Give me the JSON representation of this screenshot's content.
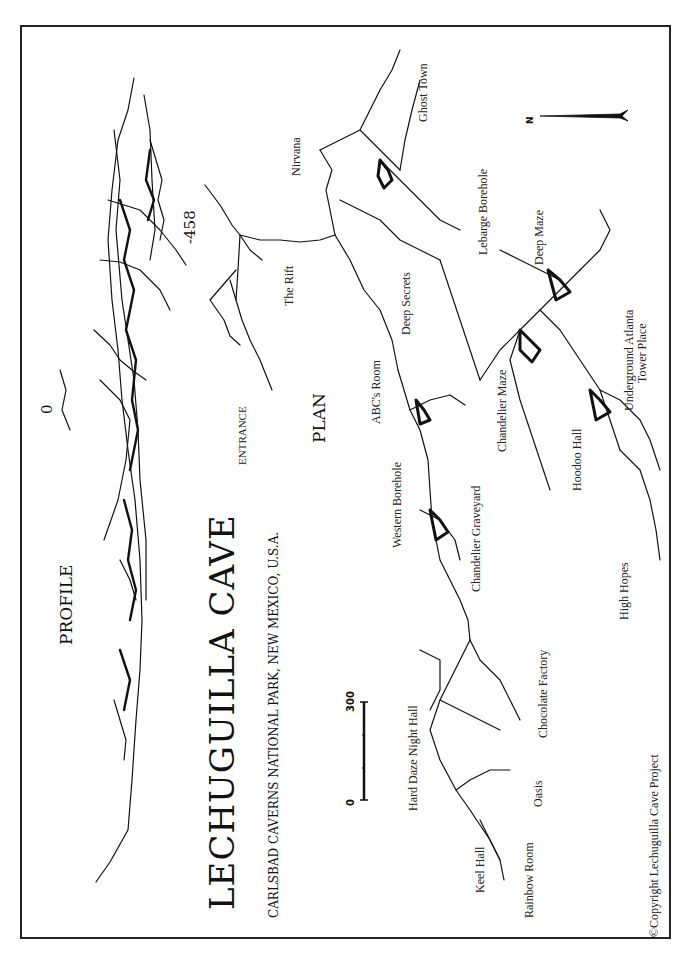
{
  "title": "LECHUGUILLA CAVE",
  "subtitle": "CARLSBAD CAVERNS NATIONAL PARK, NEW MEXICO, U.S.A.",
  "sections": {
    "profile": "PROFILE",
    "plan": "PLAN"
  },
  "profile_depths": {
    "top": "0",
    "bottom": "-458"
  },
  "north_arrow": {
    "label": "N"
  },
  "scale_bar": {
    "start": "0",
    "end": "300"
  },
  "places": [
    {
      "id": "entrance",
      "label": "ENTRANCE"
    },
    {
      "id": "the-rift",
      "label": "The Rift"
    },
    {
      "id": "nirvana",
      "label": "Nirvana"
    },
    {
      "id": "ghost-town",
      "label": "Ghost Town"
    },
    {
      "id": "lebarge-borehole",
      "label": "Lebarge Borehole"
    },
    {
      "id": "deep-secrets",
      "label": "Deep Secrets"
    },
    {
      "id": "deep-maze",
      "label": "Deep Maze"
    },
    {
      "id": "abcs-room",
      "label": "ABC's Room"
    },
    {
      "id": "chandelier-maze",
      "label": "Chandelier Maze"
    },
    {
      "id": "underground-atlanta",
      "label": "Underground Atlanta"
    },
    {
      "id": "tower-place",
      "label": "Tower Place"
    },
    {
      "id": "western-borehole",
      "label": "Western Borehole"
    },
    {
      "id": "hoodoo-hall",
      "label": "Hoodoo Hall"
    },
    {
      "id": "chandelier-graveyard",
      "label": "Chandelier Graveyard"
    },
    {
      "id": "high-hopes",
      "label": "High Hopes"
    },
    {
      "id": "chocolate-factory",
      "label": "Chocolate Factory"
    },
    {
      "id": "hard-daze-night-hall",
      "label": "Hard Daze Night Hall"
    },
    {
      "id": "oasis",
      "label": "Oasis"
    },
    {
      "id": "keel-hall",
      "label": "Keel Hall"
    },
    {
      "id": "rainbow-room",
      "label": "Rainbow Room"
    }
  ],
  "copyright": "©Copyright Lechuguilla Cave Project",
  "colors": {
    "ink": "#111111",
    "paper": "#ffffff"
  }
}
